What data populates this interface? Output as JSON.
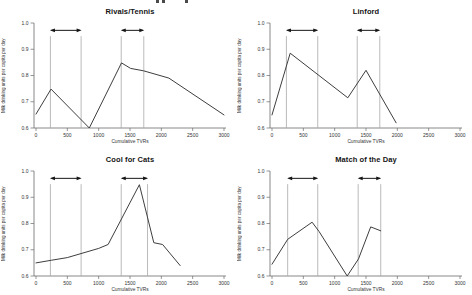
{
  "figure": {
    "background": "#ffffff",
    "note": "2x2 grid of line charts comparing milk consumption response to four TV advertising campaigns"
  },
  "colors": {
    "line": "#3e3e3e",
    "axis": "#6a6a6a",
    "guide": "#a8a8a8",
    "arrow": "#161616",
    "text": "#333333",
    "title": "#141414"
  },
  "chart_data": [
    {
      "type": "line",
      "title": "Rivals/Tennis",
      "xlabel": "Cumulative TVRs",
      "ylabel": "Milk drinking units per capita per day",
      "xlim": [
        0,
        3000
      ],
      "ylim": [
        0.6,
        1.0
      ],
      "x_ticks": [
        0,
        500,
        1000,
        1500,
        2000,
        2500,
        3000
      ],
      "y_ticks": [
        "0.6",
        "0.7",
        "0.8",
        "0.9",
        "1.0"
      ],
      "grid": false,
      "legend": "none",
      "campaign_periods": [
        [
          230,
          720
        ],
        [
          1360,
          1720
        ]
      ],
      "points": [
        [
          0,
          0.653
        ],
        [
          240,
          0.748
        ],
        [
          850,
          0.6
        ],
        [
          1365,
          0.848
        ],
        [
          1510,
          0.827
        ],
        [
          1716,
          0.818
        ],
        [
          2120,
          0.79
        ],
        [
          3000,
          0.65
        ]
      ]
    },
    {
      "type": "line",
      "title": "Linford",
      "xlabel": "Cumulative TVRs",
      "ylabel": "Milk drinking units per capita per day",
      "xlim": [
        0,
        3000
      ],
      "ylim": [
        0.6,
        1.0
      ],
      "x_ticks": [
        0,
        500,
        1000,
        1500,
        2000,
        2500,
        3000
      ],
      "y_ticks": [
        "0.6",
        "0.7",
        "0.8",
        "0.9",
        "1.0"
      ],
      "grid": false,
      "legend": "none",
      "campaign_periods": [
        [
          230,
          730
        ],
        [
          1360,
          1720
        ]
      ],
      "points": [
        [
          0,
          0.65
        ],
        [
          290,
          0.885
        ],
        [
          1210,
          0.715
        ],
        [
          1500,
          0.82
        ],
        [
          1980,
          0.62
        ]
      ]
    },
    {
      "type": "line",
      "title": "Cool for Cats",
      "xlabel": "Cumulative TVRs",
      "ylabel": "Milk drinking units per capita per day",
      "xlim": [
        0,
        3000
      ],
      "ylim": [
        0.6,
        1.0
      ],
      "x_ticks": [
        0,
        500,
        1000,
        1500,
        2000,
        2500,
        3000
      ],
      "y_ticks": [
        "0.6",
        "0.7",
        "0.8",
        "0.9",
        "1.0"
      ],
      "grid": false,
      "legend": "none",
      "campaign_periods": [
        [
          230,
          720
        ],
        [
          1360,
          1780
        ]
      ],
      "points": [
        [
          0,
          0.65
        ],
        [
          250,
          0.66
        ],
        [
          500,
          0.67
        ],
        [
          1000,
          0.705
        ],
        [
          1150,
          0.72
        ],
        [
          1650,
          0.948
        ],
        [
          1880,
          0.727
        ],
        [
          2020,
          0.72
        ],
        [
          2300,
          0.64
        ]
      ]
    },
    {
      "type": "line",
      "title": "Match of the Day",
      "xlabel": "Cumulative TVRs",
      "ylabel": "Milk drinking units per capita per day",
      "xlim": [
        0,
        3000
      ],
      "ylim": [
        0.6,
        1.0
      ],
      "x_ticks": [
        0,
        500,
        1000,
        1500,
        2000,
        2500,
        3000
      ],
      "y_ticks": [
        "0.6",
        "0.7",
        "0.8",
        "0.9",
        "1.0"
      ],
      "grid": false,
      "legend": "none",
      "campaign_periods": [
        [
          250,
          730
        ],
        [
          1375,
          1735
        ]
      ],
      "points": [
        [
          0,
          0.645
        ],
        [
          250,
          0.74
        ],
        [
          640,
          0.805
        ],
        [
          750,
          0.77
        ],
        [
          1200,
          0.6
        ],
        [
          1380,
          0.665
        ],
        [
          1575,
          0.787
        ],
        [
          1735,
          0.772
        ]
      ]
    }
  ]
}
